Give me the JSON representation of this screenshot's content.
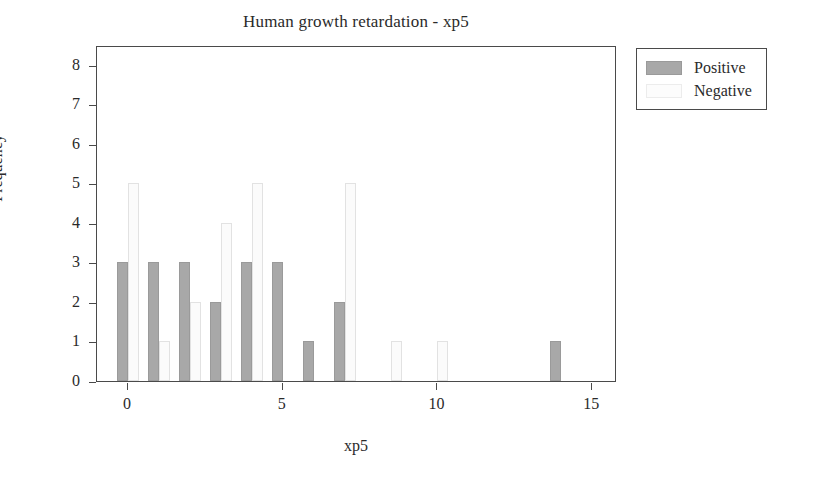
{
  "chart_data": {
    "type": "bar",
    "title": "Human growth retardation - xp5",
    "xlabel": "xp5",
    "ylabel": "Frequency",
    "xlim": [
      -1.0,
      15.8
    ],
    "ylim": [
      0,
      8.5
    ],
    "xticks": [
      "0",
      "5",
      "10",
      "15"
    ],
    "xtick_values": [
      0,
      5,
      10,
      15
    ],
    "yticks": [
      "0",
      "1",
      "2",
      "3",
      "4",
      "5",
      "6",
      "7",
      "8"
    ],
    "ytick_values": [
      0,
      1,
      2,
      3,
      4,
      5,
      6,
      7,
      8
    ],
    "grid": false,
    "legend_position": "upper-right-outside",
    "categories": [
      0,
      1,
      2,
      3,
      4,
      5,
      6,
      7,
      8.5,
      10,
      14
    ],
    "series": [
      {
        "name": "Positive",
        "color": "#a8a8a8",
        "values": [
          3,
          3,
          3,
          2,
          3,
          3,
          1,
          2,
          0,
          0,
          1
        ]
      },
      {
        "name": "Negative",
        "color": "#fbfbfb",
        "values": [
          5,
          1,
          2,
          4,
          5,
          0,
          0,
          5,
          1,
          1,
          0
        ]
      }
    ],
    "bars": [
      {
        "x": 0,
        "series": "Positive",
        "value": 3
      },
      {
        "x": 0,
        "series": "Negative",
        "value": 5
      },
      {
        "x": 1,
        "series": "Positive",
        "value": 3
      },
      {
        "x": 1,
        "series": "Negative",
        "value": 1
      },
      {
        "x": 2,
        "series": "Positive",
        "value": 3
      },
      {
        "x": 2,
        "series": "Negative",
        "value": 2
      },
      {
        "x": 3,
        "series": "Positive",
        "value": 2
      },
      {
        "x": 3,
        "series": "Negative",
        "value": 4
      },
      {
        "x": 4,
        "series": "Positive",
        "value": 3
      },
      {
        "x": 4,
        "series": "Negative",
        "value": 5
      },
      {
        "x": 5,
        "series": "Positive",
        "value": 3
      },
      {
        "x": 6,
        "series": "Positive",
        "value": 1
      },
      {
        "x": 7,
        "series": "Positive",
        "value": 2
      },
      {
        "x": 7,
        "series": "Negative",
        "value": 5
      },
      {
        "x": 8.5,
        "series": "Negative",
        "value": 1
      },
      {
        "x": 10,
        "series": "Negative",
        "value": 1
      },
      {
        "x": 14,
        "series": "Positive",
        "value": 1
      }
    ]
  },
  "legend": {
    "items": [
      {
        "label": "Positive",
        "swatch": "positive"
      },
      {
        "label": "Negative",
        "swatch": "negative"
      }
    ]
  }
}
